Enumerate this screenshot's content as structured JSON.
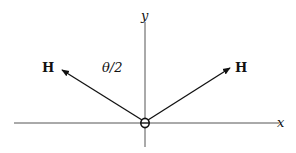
{
  "diagram": {
    "axes": {
      "x_label": "x",
      "y_label": "y"
    },
    "vectors": [
      {
        "label": "H",
        "direction": "upper-left"
      },
      {
        "label": "H",
        "direction": "upper-right"
      }
    ],
    "angle_label": "θ/2",
    "origin_symbol": "circle-with-bar",
    "colors": {
      "stroke": "#111111",
      "background": "#ffffff"
    }
  }
}
